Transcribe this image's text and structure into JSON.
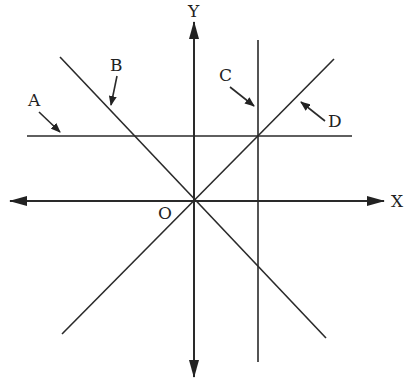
{
  "diagram": {
    "type": "coordinate-lines",
    "origin": {
      "label": "O",
      "x": 194,
      "y": 201
    },
    "axes": {
      "x": {
        "label": "X",
        "from": [
          12,
          201
        ],
        "to": [
          384,
          201
        ],
        "bidirectional": true
      },
      "y": {
        "label": "Y",
        "from": [
          194,
          374
        ],
        "to": [
          194,
          22
        ],
        "bidirectional": true
      }
    },
    "lines": [
      {
        "id": "A",
        "label": "A",
        "kind": "horizontal",
        "from": [
          27,
          136
        ],
        "to": [
          352,
          136
        ],
        "label_pos": [
          36,
          104
        ],
        "pointer": {
          "from": [
            38,
            111
          ],
          "to": [
            60,
            132
          ]
        }
      },
      {
        "id": "B",
        "label": "B",
        "kind": "negative-slope through origin",
        "from": [
          60,
          57
        ],
        "to": [
          326,
          338
        ],
        "label_pos": [
          117,
          70
        ],
        "pointer": {
          "from": [
            118,
            76
          ],
          "to": [
            110,
            105
          ]
        }
      },
      {
        "id": "C",
        "label": "C",
        "kind": "vertical",
        "from": [
          258,
          40
        ],
        "to": [
          258,
          362
        ],
        "label_pos": [
          226,
          80
        ],
        "pointer": {
          "from": [
            230,
            87
          ],
          "to": [
            254,
            107
          ]
        }
      },
      {
        "id": "D",
        "label": "D",
        "kind": "positive-slope through origin",
        "from": [
          62,
          334
        ],
        "to": [
          334,
          59
        ],
        "label_pos": [
          337,
          126
        ],
        "pointer": {
          "from": [
            325,
            121
          ],
          "to": [
            300,
            101
          ]
        }
      }
    ],
    "labels": {
      "x_axis": "X",
      "y_axis": "Y",
      "origin": "O",
      "A": "A",
      "B": "B",
      "C": "C",
      "D": "D"
    }
  }
}
